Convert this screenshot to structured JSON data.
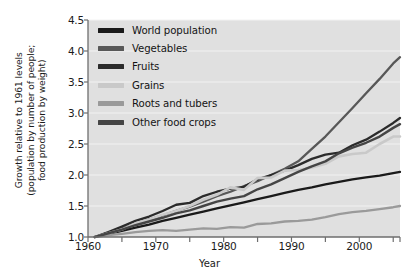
{
  "chart_data": {
    "type": "line",
    "title": "",
    "xlabel": "Year",
    "ylabel_line1": "Growth relative to 1961 levels",
    "ylabel_line2": "(population by number of people;",
    "ylabel_line3": "food production by weight)",
    "xlim": [
      1960,
      2006
    ],
    "ylim": [
      1.0,
      4.5
    ],
    "xticks": [
      1960,
      1970,
      1980,
      1990,
      2000
    ],
    "xtick_labels": [
      "1960",
      "1970",
      "1980",
      "1990",
      "2000"
    ],
    "xminor_ticks": [
      1965,
      1975,
      1985,
      1995,
      2005
    ],
    "yticks": [
      1.0,
      1.5,
      2.0,
      2.5,
      3.0,
      3.5,
      4.0,
      4.5
    ],
    "ytick_labels": [
      "1.0",
      "1.5",
      "2.0",
      "2.5",
      "3.0",
      "3.5",
      "4.0",
      "4.5"
    ],
    "grid": true,
    "grid_color": "#f2f2f2",
    "plot_bg": "#e0e0e0",
    "legend_position": "upper-left-inside",
    "x": [
      1961,
      1963,
      1965,
      1967,
      1969,
      1971,
      1973,
      1975,
      1977,
      1979,
      1981,
      1983,
      1985,
      1987,
      1989,
      1991,
      1993,
      1995,
      1997,
      1999,
      2001,
      2003,
      2005,
      2006
    ],
    "series": [
      {
        "name": "World population",
        "color": "#1a1a1a",
        "width": 2.3,
        "values": [
          1.0,
          1.05,
          1.1,
          1.15,
          1.2,
          1.26,
          1.31,
          1.36,
          1.41,
          1.46,
          1.51,
          1.56,
          1.61,
          1.66,
          1.71,
          1.76,
          1.8,
          1.85,
          1.89,
          1.93,
          1.96,
          1.99,
          2.03,
          2.05
        ]
      },
      {
        "name": "Vegetables",
        "color": "#585858",
        "width": 2.3,
        "values": [
          1.0,
          1.07,
          1.14,
          1.21,
          1.28,
          1.35,
          1.42,
          1.49,
          1.57,
          1.66,
          1.73,
          1.82,
          1.9,
          2.0,
          2.1,
          2.22,
          2.42,
          2.62,
          2.85,
          3.08,
          3.32,
          3.55,
          3.8,
          3.9
        ]
      },
      {
        "name": "Fruits",
        "color": "#2b2b2b",
        "width": 2.3,
        "values": [
          1.0,
          1.08,
          1.17,
          1.26,
          1.33,
          1.42,
          1.52,
          1.55,
          1.66,
          1.73,
          1.78,
          1.81,
          1.93,
          2.0,
          2.07,
          2.16,
          2.26,
          2.33,
          2.36,
          2.48,
          2.57,
          2.7,
          2.84,
          2.92
        ]
      },
      {
        "name": "Grains",
        "color": "#c9c9c9",
        "width": 2.6,
        "values": [
          1.0,
          1.06,
          1.12,
          1.22,
          1.28,
          1.36,
          1.42,
          1.5,
          1.6,
          1.68,
          1.8,
          1.76,
          1.95,
          1.96,
          2.07,
          2.08,
          2.12,
          2.18,
          2.3,
          2.34,
          2.36,
          2.5,
          2.62,
          2.62
        ]
      },
      {
        "name": "Roots and tubers",
        "color": "#9a9a9a",
        "width": 2.3,
        "values": [
          1.0,
          1.03,
          1.05,
          1.08,
          1.1,
          1.11,
          1.1,
          1.12,
          1.14,
          1.13,
          1.16,
          1.15,
          1.21,
          1.22,
          1.25,
          1.26,
          1.28,
          1.32,
          1.37,
          1.4,
          1.42,
          1.45,
          1.48,
          1.5
        ]
      },
      {
        "name": "Other food crops",
        "color": "#454545",
        "width": 2.4,
        "values": [
          1.0,
          1.06,
          1.12,
          1.19,
          1.25,
          1.31,
          1.38,
          1.43,
          1.5,
          1.57,
          1.62,
          1.66,
          1.77,
          1.85,
          1.95,
          2.05,
          2.14,
          2.22,
          2.35,
          2.44,
          2.52,
          2.62,
          2.76,
          2.82
        ]
      }
    ]
  },
  "legend": {
    "items": [
      {
        "label": "World population",
        "color": "#1a1a1a"
      },
      {
        "label": "Vegetables",
        "color": "#585858"
      },
      {
        "label": "Fruits",
        "color": "#2b2b2b"
      },
      {
        "label": "Grains",
        "color": "#c9c9c9"
      },
      {
        "label": "Roots and tubers",
        "color": "#9a9a9a"
      },
      {
        "label": "Other food crops",
        "color": "#454545"
      }
    ]
  }
}
